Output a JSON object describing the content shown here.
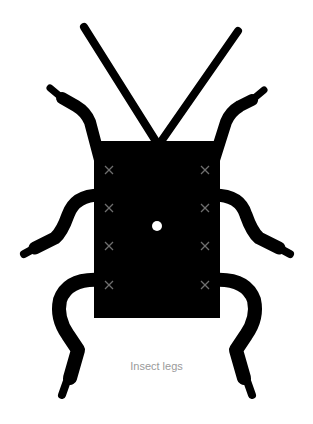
{
  "caption": "Insect legs",
  "colors": {
    "body": "#000000",
    "marker": "#6e6e6e",
    "caption": "#9a9a9a",
    "background": "#ffffff"
  },
  "diagram": {
    "body": {
      "x": 94,
      "y": 141,
      "width": 126,
      "height": 177
    },
    "center_dot": {
      "cx": 157,
      "cy": 226,
      "r": 5
    },
    "markers": {
      "left_x": 109,
      "right_x": 205,
      "y": [
        170,
        208,
        246,
        285
      ],
      "glyph": "x-mark"
    },
    "antennae": 2,
    "legs": 6
  }
}
